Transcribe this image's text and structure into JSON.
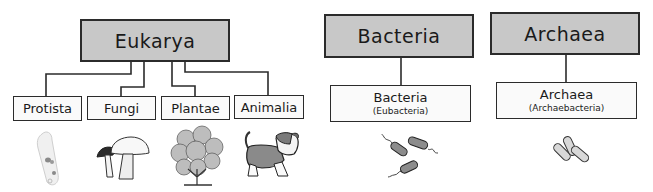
{
  "diagram": {
    "type": "classification-tree",
    "domains": [
      {
        "label": "Eukarya",
        "children": [
          {
            "label": "Protista",
            "image": "paramecium-icon"
          },
          {
            "label": "Fungi",
            "image": "mushroom-icon"
          },
          {
            "label": "Plantae",
            "image": "plant-icon"
          },
          {
            "label": "Animalia",
            "image": "dog-icon"
          }
        ]
      },
      {
        "label": "Bacteria",
        "children": [
          {
            "label": "Bacteria",
            "sublabel": "(Eubacteria)",
            "image": "flagellated-bacteria-icon"
          }
        ]
      },
      {
        "label": "Archaea",
        "children": [
          {
            "label": "Archaea",
            "sublabel": "(Archaebacteria)",
            "image": "archaea-cells-icon"
          }
        ]
      }
    ],
    "colors": {
      "domain_fill": "#c8c8c8",
      "kingdom_fill": "#fafafa",
      "line": "#2b2b2b"
    }
  }
}
